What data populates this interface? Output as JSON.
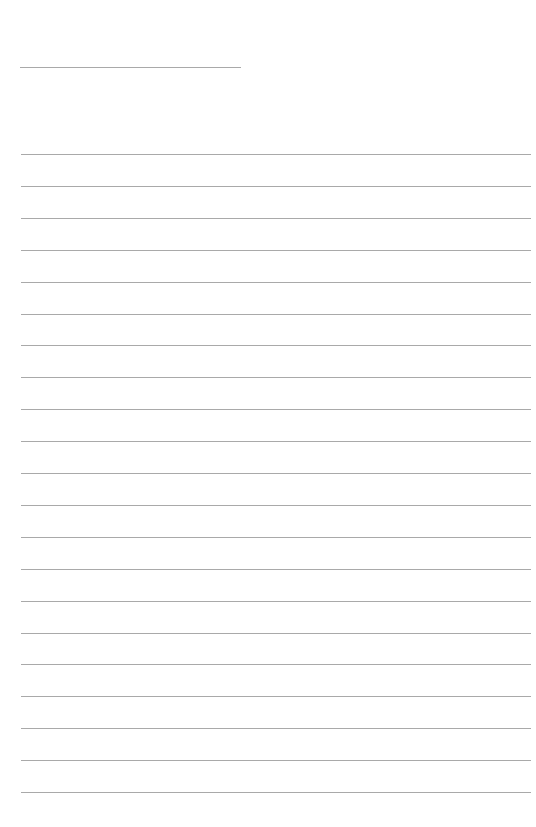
{
  "page": {
    "type": "lined-paper",
    "background": "#ffffff",
    "line_color": "#a9a9a9",
    "header_line": {
      "x1": 20,
      "x2": 241,
      "y": 67
    },
    "ruled_lines": {
      "x1": 21,
      "x2": 531,
      "start_y": 154,
      "pitch": 31.9,
      "count": 21
    }
  }
}
